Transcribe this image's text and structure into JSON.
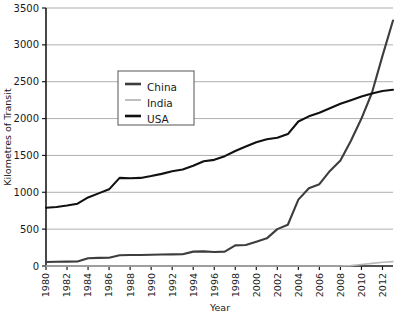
{
  "chart_data": {
    "type": "line",
    "title": "",
    "xlabel": "Year",
    "ylabel": "Kilometres of Transit",
    "xlim": [
      1980,
      2013
    ],
    "ylim": [
      0,
      3500
    ],
    "grid": true,
    "grid_axis": "y",
    "legend_position": "upper-left-inside",
    "ytick_labels": [
      "0",
      "500",
      "1000",
      "1500",
      "2000",
      "2500",
      "3000",
      "3500"
    ],
    "ytick_values": [
      0,
      500,
      1000,
      1500,
      2000,
      2500,
      3000,
      3500
    ],
    "xtick_labels": [
      "1980",
      "1982",
      "1984",
      "1986",
      "1988",
      "1990",
      "1992",
      "1994",
      "1996",
      "1998",
      "2000",
      "2002",
      "2004",
      "2006",
      "2008",
      "2010",
      "2012"
    ],
    "xtick_values": [
      1980,
      1982,
      1984,
      1986,
      1988,
      1990,
      1992,
      1994,
      1996,
      1998,
      2000,
      2002,
      2004,
      2006,
      2008,
      2010,
      2012
    ],
    "x": [
      1980,
      1981,
      1982,
      1983,
      1984,
      1985,
      1986,
      1987,
      1988,
      1989,
      1990,
      1991,
      1992,
      1993,
      1994,
      1995,
      1996,
      1997,
      1998,
      1999,
      2000,
      2001,
      2002,
      2003,
      2004,
      2005,
      2006,
      2007,
      2008,
      2009,
      2010,
      2011,
      2012,
      2013
    ],
    "series": [
      {
        "name": "China",
        "color": "#3d3d3d",
        "values": [
          55,
          58,
          60,
          62,
          105,
          110,
          112,
          145,
          150,
          150,
          152,
          155,
          158,
          160,
          195,
          198,
          190,
          195,
          280,
          285,
          330,
          375,
          500,
          560,
          900,
          1055,
          1110,
          1290,
          1430,
          1700,
          2000,
          2350,
          2850,
          3330
        ]
      },
      {
        "name": "India",
        "color": "#b8b8b8",
        "values": [
          0,
          0,
          0,
          0,
          0,
          0,
          0,
          0,
          0,
          0,
          0,
          0,
          0,
          0,
          0,
          0,
          0,
          0,
          0,
          0,
          0,
          0,
          0,
          0,
          0,
          0,
          0,
          0,
          0,
          5,
          20,
          35,
          50,
          60
        ]
      },
      {
        "name": "USA",
        "color": "#111111",
        "values": [
          790,
          800,
          820,
          845,
          930,
          985,
          1040,
          1195,
          1190,
          1195,
          1220,
          1250,
          1285,
          1310,
          1360,
          1420,
          1440,
          1490,
          1560,
          1620,
          1680,
          1720,
          1740,
          1790,
          1960,
          2030,
          2080,
          2140,
          2200,
          2250,
          2300,
          2340,
          2375,
          2390
        ]
      }
    ]
  },
  "legend": {
    "entries": [
      {
        "label": "China",
        "color": "#3d3d3d"
      },
      {
        "label": "India",
        "color": "#b8b8b8"
      },
      {
        "label": "USA",
        "color": "#111111"
      }
    ]
  },
  "axis": {
    "y_title": "Kilometres of Transit",
    "x_title": "Year"
  }
}
